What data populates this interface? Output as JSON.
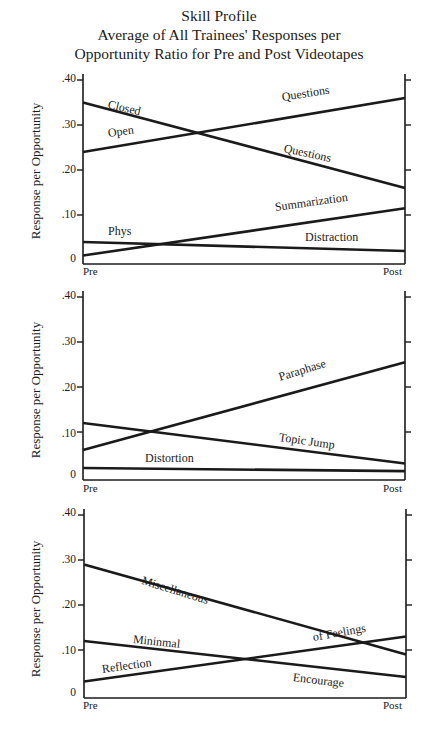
{
  "title": {
    "line1": "Skill Profile",
    "line2": "Average of All Trainees' Responses per",
    "line3": "Opportunity Ratio for Pre and Post Videotapes"
  },
  "axis": {
    "ylabel": "Response per Opportunity",
    "yticks": [
      ".40",
      ".30",
      ".20",
      ".10",
      "0"
    ],
    "xticks": [
      "Pre",
      "Post"
    ]
  },
  "panels": [
    {
      "labels": {
        "closed": "Closed",
        "closed_q": "Questions",
        "open": "Open",
        "open_q": "Questions",
        "summarization": "Summarization",
        "phys": "Phys",
        "distraction": "Distraction"
      }
    },
    {
      "labels": {
        "paraphase": "Paraphase",
        "topic_jump": "Topic Jump",
        "distortion": "Distortion"
      }
    },
    {
      "labels": {
        "misc": "Miscellaneous",
        "of_feelings": "of Feelings",
        "minimal": "Mininmal",
        "reflection": "Reflection",
        "encourage": "Encourage"
      }
    }
  ],
  "chart_data": [
    {
      "type": "line",
      "title": "Skill Profile — Average of All Trainees' Responses per Opportunity Ratio for Pre and Post Videotapes",
      "xlabel": "",
      "ylabel": "Response per Opportunity",
      "categories": [
        "Pre",
        "Post"
      ],
      "ylim": [
        0,
        0.4
      ],
      "grid": false,
      "series": [
        {
          "name": "Closed Questions",
          "values": [
            0.35,
            0.16
          ]
        },
        {
          "name": "Open Questions",
          "values": [
            0.24,
            0.36
          ]
        },
        {
          "name": "Summarization",
          "values": [
            0.01,
            0.115
          ]
        },
        {
          "name": "Phys Distraction",
          "values": [
            0.04,
            0.02
          ]
        }
      ]
    },
    {
      "type": "line",
      "xlabel": "",
      "ylabel": "Response per Opportunity",
      "categories": [
        "Pre",
        "Post"
      ],
      "ylim": [
        0,
        0.4
      ],
      "grid": false,
      "series": [
        {
          "name": "Paraphase",
          "values": [
            0.06,
            0.255
          ]
        },
        {
          "name": "Topic Jump",
          "values": [
            0.12,
            0.03
          ]
        },
        {
          "name": "Distortion",
          "values": [
            0.02,
            0.013
          ]
        }
      ]
    },
    {
      "type": "line",
      "xlabel": "",
      "ylabel": "Response per Opportunity",
      "categories": [
        "Pre",
        "Post"
      ],
      "ylim": [
        0,
        0.4
      ],
      "grid": false,
      "series": [
        {
          "name": "Miscellaneous",
          "values": [
            0.29,
            0.09
          ]
        },
        {
          "name": "Reflection of Feelings",
          "values": [
            0.03,
            0.13
          ]
        },
        {
          "name": "Mininmal Encourage",
          "values": [
            0.12,
            0.04
          ]
        }
      ]
    }
  ]
}
